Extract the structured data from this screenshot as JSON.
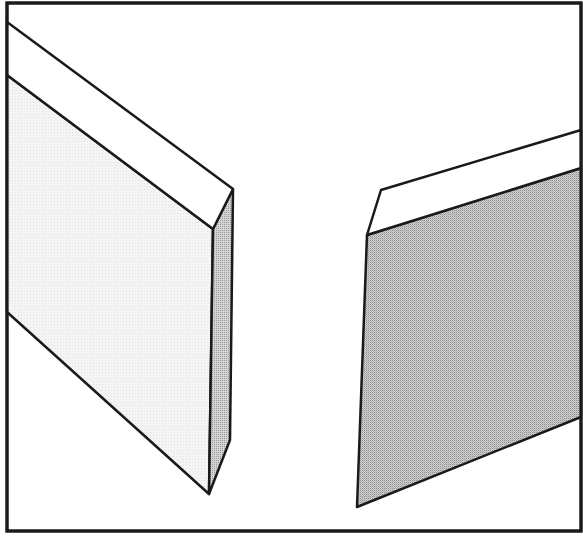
{
  "figure": {
    "colors": {
      "stroke": "#1a1a1a",
      "background": "#ffffff",
      "bevel": "#ffffff",
      "left_front_face": "#f2f2f2",
      "left_side_face": "#c8c8c8",
      "right_face": "#c4c4c4"
    },
    "frame": {
      "x1": 7,
      "y1": 3,
      "x2": 581,
      "y2": 531
    },
    "left_blade": {
      "bevel": [
        [
          7,
          22
        ],
        [
          233,
          189
        ],
        [
          213,
          229
        ],
        [
          7,
          75
        ]
      ],
      "front_face": [
        [
          7,
          75
        ],
        [
          213,
          229
        ],
        [
          209,
          494
        ],
        [
          7,
          312
        ]
      ],
      "side_face": [
        [
          213,
          229
        ],
        [
          233,
          189
        ],
        [
          230,
          440
        ],
        [
          209,
          494
        ]
      ]
    },
    "right_blade": {
      "bevel": [
        [
          381,
          190
        ],
        [
          581,
          130
        ],
        [
          581,
          168
        ],
        [
          367,
          235
        ]
      ],
      "face": [
        [
          367,
          235
        ],
        [
          581,
          168
        ],
        [
          581,
          417
        ],
        [
          357,
          507
        ]
      ]
    }
  }
}
